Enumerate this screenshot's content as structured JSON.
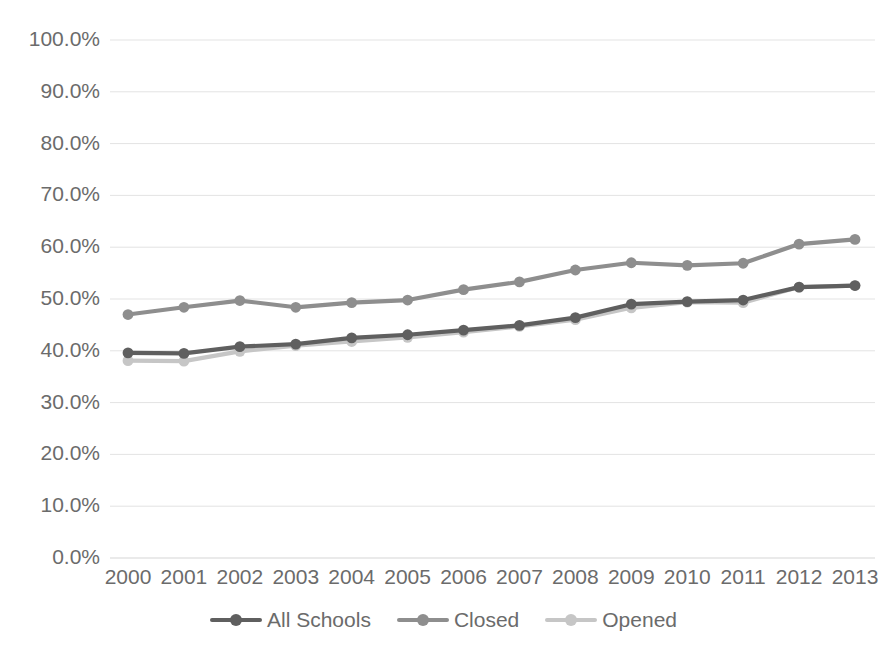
{
  "chart_data": {
    "type": "line",
    "title": "",
    "subtitle": "",
    "xlabel": "",
    "ylabel": "",
    "categories": [
      "2000",
      "2001",
      "2002",
      "2003",
      "2004",
      "2005",
      "2006",
      "2007",
      "2008",
      "2009",
      "2010",
      "2011",
      "2012",
      "2013"
    ],
    "ylim": [
      0,
      100
    ],
    "ytick_values": [
      0,
      10,
      20,
      30,
      40,
      50,
      60,
      70,
      80,
      90,
      100
    ],
    "ytick_labels": [
      "0.0%",
      "10.0%",
      "20.0%",
      "30.0%",
      "40.0%",
      "50.0%",
      "60.0%",
      "70.0%",
      "80.0%",
      "90.0%",
      "100.0%"
    ],
    "grid": true,
    "grid_axis": "y",
    "legend_position": "bottom",
    "markers": "circle",
    "series": [
      {
        "name": "All Schools",
        "color": "#5f5f5f",
        "values": [
          39.6,
          39.5,
          40.8,
          41.3,
          42.5,
          43.1,
          44.0,
          44.9,
          46.4,
          49.0,
          49.5,
          49.8,
          52.3,
          52.6
        ]
      },
      {
        "name": "Closed",
        "color": "#8e8e8e",
        "values": [
          47.0,
          48.4,
          49.7,
          48.4,
          49.3,
          49.8,
          51.8,
          53.3,
          55.6,
          57.0,
          56.5,
          56.9,
          60.6,
          61.5
        ]
      },
      {
        "name": "Opened",
        "color": "#c6c6c6",
        "values": [
          38.1,
          38.0,
          39.9,
          41.0,
          41.8,
          42.6,
          43.6,
          44.7,
          46.0,
          48.3,
          49.4,
          49.3,
          52.3,
          52.6
        ]
      }
    ]
  },
  "legend": {
    "items": [
      {
        "label": "All Schools",
        "color": "#5f5f5f"
      },
      {
        "label": "Closed",
        "color": "#8e8e8e"
      },
      {
        "label": "Opened",
        "color": "#c6c6c6"
      }
    ]
  },
  "axes": {
    "y_labels": [
      "100.0%",
      "90.0%",
      "80.0%",
      "70.0%",
      "60.0%",
      "50.0%",
      "40.0%",
      "30.0%",
      "20.0%",
      "10.0%",
      "0.0%"
    ],
    "x_labels": [
      "2000",
      "2001",
      "2002",
      "2003",
      "2004",
      "2005",
      "2006",
      "2007",
      "2008",
      "2009",
      "2010",
      "2011",
      "2012",
      "2013"
    ]
  },
  "colors": {
    "grid": "#e3e3e3",
    "axis_text": "#6b6b6b",
    "background": "#ffffff"
  }
}
